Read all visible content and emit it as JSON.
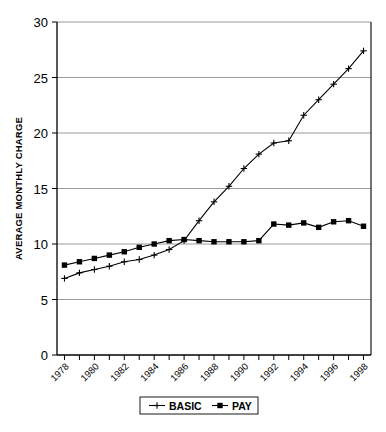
{
  "chart_data": {
    "type": "line",
    "title": "",
    "xlabel": "",
    "ylabel": "AVERAGE MONTHLY CHARGE",
    "x": [
      1978,
      1979,
      1980,
      1981,
      1982,
      1983,
      1984,
      1985,
      1986,
      1987,
      1988,
      1989,
      1990,
      1991,
      1992,
      1993,
      1994,
      1995,
      1996,
      1997,
      1998
    ],
    "xlim": [
      1977.5,
      1998.5
    ],
    "ylim": [
      0,
      30
    ],
    "yticks": [
      0,
      5,
      10,
      15,
      20,
      25,
      30
    ],
    "xticklabels": [
      "1978",
      "",
      "1980",
      "",
      "1982",
      "",
      "1984",
      "",
      "1986",
      "",
      "1988",
      "",
      "1990",
      "",
      "1992",
      "",
      "1994",
      "",
      "1996",
      "",
      "1998"
    ],
    "xticklabels_shown": [
      "1978",
      "1980",
      "1982",
      "1984",
      "1986",
      "1988",
      "1990",
      "1992",
      "1994",
      "1996",
      "1998"
    ],
    "grid": "horizontal",
    "legend_position": "bottom",
    "series": [
      {
        "name": "BASIC",
        "marker": "plus",
        "color": "#000000",
        "values": [
          6.9,
          7.4,
          7.7,
          8.0,
          8.4,
          8.6,
          9.0,
          9.5,
          10.3,
          12.1,
          13.8,
          15.2,
          16.8,
          18.1,
          19.1,
          19.3,
          21.6,
          23.0,
          24.4,
          25.8,
          27.4
        ]
      },
      {
        "name": "PAY",
        "marker": "square",
        "color": "#000000",
        "values": [
          8.1,
          8.4,
          8.7,
          9.0,
          9.3,
          9.7,
          10.0,
          10.3,
          10.4,
          10.3,
          10.2,
          10.2,
          10.2,
          10.3,
          11.8,
          11.7,
          11.9,
          11.5,
          12.0,
          12.1,
          11.6
        ]
      }
    ]
  },
  "legend": {
    "items": [
      {
        "label": "BASIC",
        "marker": "plus"
      },
      {
        "label": "PAY",
        "marker": "square"
      }
    ]
  },
  "axis": {
    "y_title": "AVERAGE MONTHLY CHARGE"
  }
}
